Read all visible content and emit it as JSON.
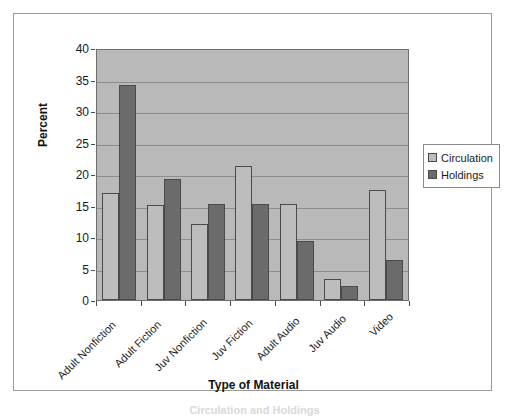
{
  "chart_data": {
    "type": "bar",
    "title": "",
    "xlabel": "Type of Material",
    "ylabel": "Percent",
    "categories": [
      "Adult Nonfiction",
      "Adult Fiction",
      "Juv Nonfiction",
      "Juv Fiction",
      "Adult Audio",
      "Juv Audio",
      "Video"
    ],
    "series": [
      {
        "name": "Circulation",
        "color": "#bdbdbd",
        "values": [
          17.0,
          15.1,
          12.1,
          21.3,
          15.3,
          3.4,
          17.5
        ]
      },
      {
        "name": "Holdings",
        "color": "#6b6b6b",
        "values": [
          34.2,
          19.2,
          15.2,
          15.3,
          9.4,
          2.3,
          6.4
        ]
      }
    ],
    "ylim": [
      0,
      40
    ],
    "yticks": [
      0,
      5,
      10,
      15,
      20,
      25,
      30,
      35,
      40
    ],
    "ytick_labels": [
      "0",
      "5",
      "10",
      "15",
      "20",
      "25",
      "30",
      "35",
      "40"
    ],
    "grid": true,
    "legend_position": "right",
    "plot_background": "#b9b9b9"
  },
  "legend": {
    "entries": [
      {
        "label": "Circulation"
      },
      {
        "label": "Holdings"
      }
    ]
  },
  "caption": "Circulation and Holdings"
}
